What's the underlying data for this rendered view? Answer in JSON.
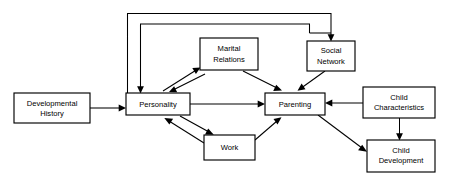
{
  "diagram": {
    "background_color": "#ffffff",
    "line_color": "#000000",
    "box_fill_color": "#ffffff",
    "nodes": [
      {
        "id": "developmental_history",
        "label_line1": "Developmental",
        "label_line2": "History",
        "x": 14,
        "y": 93,
        "w": 76,
        "h": 30
      },
      {
        "id": "personality",
        "label_line1": "Personality",
        "label_line2": "",
        "x": 126,
        "y": 93,
        "w": 64,
        "h": 22
      },
      {
        "id": "marital_relations",
        "label_line1": "Marital",
        "label_line2": "Relations",
        "x": 200,
        "y": 38,
        "w": 58,
        "h": 32
      },
      {
        "id": "social_network",
        "label_line1": "Social",
        "label_line2": "Network",
        "x": 307,
        "y": 41,
        "w": 48,
        "h": 30
      },
      {
        "id": "parenting",
        "label_line1": "Parenting",
        "label_line2": "",
        "x": 265,
        "y": 93,
        "w": 60,
        "h": 22
      },
      {
        "id": "work",
        "label_line1": "Work",
        "label_line2": "",
        "x": 204,
        "y": 135,
        "w": 51,
        "h": 25
      },
      {
        "id": "child_characteristics",
        "label_line1": "Child",
        "label_line2": "Characteristics",
        "x": 363,
        "y": 87,
        "w": 72,
        "h": 31
      },
      {
        "id": "child_development",
        "label_line1": "Child",
        "label_line2": "Development",
        "x": 367,
        "y": 140,
        "w": 68,
        "h": 32
      }
    ],
    "edges": [
      {
        "id": "developmental-history-to-personality",
        "from": "developmental_history",
        "to": "personality"
      },
      {
        "id": "personality-to-marital-relations",
        "from": "personality",
        "to": "marital_relations"
      },
      {
        "id": "marital-relations-to-personality",
        "from": "marital_relations",
        "to": "personality"
      },
      {
        "id": "marital-relations-to-parenting",
        "from": "marital_relations",
        "to": "parenting"
      },
      {
        "id": "social-network-to-parenting",
        "from": "social_network",
        "to": "parenting"
      },
      {
        "id": "personality-to-work",
        "from": "personality",
        "to": "work"
      },
      {
        "id": "work-to-personality",
        "from": "work",
        "to": "personality"
      },
      {
        "id": "work-to-parenting",
        "from": "work",
        "to": "parenting"
      },
      {
        "id": "personality-to-parenting",
        "from": "personality",
        "to": "parenting"
      },
      {
        "id": "child-characteristics-to-parenting",
        "from": "child_characteristics",
        "to": "parenting"
      },
      {
        "id": "child-characteristics-to-child-development",
        "from": "child_characteristics",
        "to": "child_development"
      },
      {
        "id": "parenting-to-child-development",
        "from": "parenting",
        "to": "child_development"
      },
      {
        "id": "feedback-outer-to-social-network",
        "from": "personality",
        "to": "social_network"
      },
      {
        "id": "feedback-inner-to-personality",
        "from": "social_network",
        "to": "personality"
      }
    ]
  }
}
